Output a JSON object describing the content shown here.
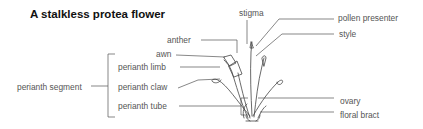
{
  "title": "A stalkless protea flower",
  "labels": {
    "stigma": "stigma",
    "pollen_presenter": "pollen presenter",
    "style": "style",
    "anther": "anther",
    "awn": "awn",
    "perianth_limb": "perianth limb",
    "perianth_claw": "perianth claw",
    "perianth_tube": "perianth tube",
    "perianth_segment": "perianth segment",
    "ovary": "ovary",
    "floral_bract": "floral bract"
  },
  "colors": {
    "text": "#555555",
    "title": "#111111",
    "line": "#555555",
    "drawing": "#444444"
  }
}
